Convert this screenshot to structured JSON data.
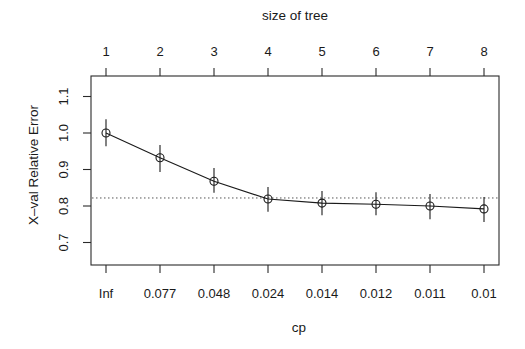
{
  "chart_data": {
    "type": "line",
    "title": "",
    "top_axis_title": "size of tree",
    "xlabel": "cp",
    "ylabel": "X–val Relative Error",
    "x_top_ticks": [
      "1",
      "2",
      "3",
      "4",
      "5",
      "6",
      "7",
      "8"
    ],
    "x_bottom_ticks": [
      "Inf",
      "0.077",
      "0.048",
      "0.024",
      "0.014",
      "0.012",
      "0.011",
      "0.01"
    ],
    "y_ticks": [
      "0.7",
      "0.8",
      "0.9",
      "1.0",
      "1.1"
    ],
    "y_tick_values": [
      0.7,
      0.8,
      0.9,
      1.0,
      1.1
    ],
    "ylim": [
      0.635,
      1.15
    ],
    "grid": false,
    "legend": null,
    "series": [
      {
        "name": "X-val Relative Error",
        "x": [
          1,
          2,
          3,
          4,
          5,
          6,
          7,
          8
        ],
        "values": [
          1.0,
          0.932,
          0.868,
          0.819,
          0.808,
          0.805,
          0.8,
          0.792
        ],
        "error_upper": [
          1.038,
          0.967,
          0.904,
          0.852,
          0.841,
          0.838,
          0.833,
          0.825
        ],
        "error_lower": [
          0.964,
          0.893,
          0.836,
          0.784,
          0.775,
          0.775,
          0.764,
          0.756
        ],
        "marker": "open-circle"
      }
    ],
    "reference_line": {
      "y": 0.822,
      "style": "dotted",
      "description": "min xerror + 1 SE"
    }
  },
  "colors": {
    "ink": "#1a1a1a",
    "frame": "#2a2a2a",
    "refline": "#555555",
    "background": "#ffffff"
  }
}
